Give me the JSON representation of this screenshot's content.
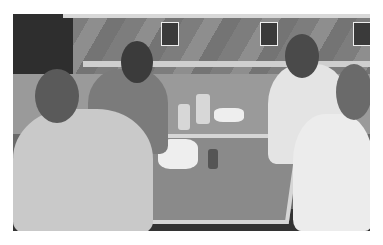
{
  "photo": {
    "description": "Black-and-white photograph of four men seated around a restaurant table, smiling at the camera",
    "style": "grayscale",
    "scene": "restaurant booth with diagonal wood-paneled wall and small posters",
    "people_count": 4,
    "colors": {
      "border": "#ffffff",
      "wall": "#858585",
      "table_edge": "#d6d6d6",
      "shadow": "#2e2e2e"
    }
  }
}
